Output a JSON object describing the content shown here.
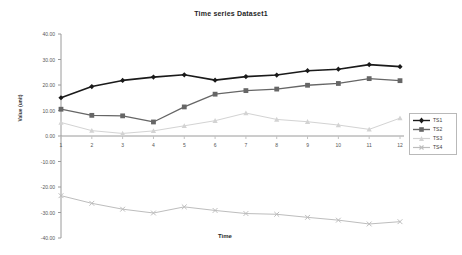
{
  "chart_data": {
    "type": "line",
    "title": "Time series Dataset1",
    "xlabel": "Time",
    "ylabel": "Value (unit)",
    "x": [
      1,
      2,
      3,
      4,
      5,
      6,
      7,
      8,
      9,
      10,
      11,
      12
    ],
    "categories": [
      "1",
      "2",
      "3",
      "4",
      "5",
      "6",
      "7",
      "8",
      "9",
      "10",
      "11",
      "12"
    ],
    "xlim": [
      1,
      12
    ],
    "ylim": [
      -40,
      40
    ],
    "ytick_labels": [
      "40.00",
      "30.00",
      "20.00",
      "10.00",
      "0.00",
      "-10.00",
      "-20.00",
      "-30.00",
      "-40.00"
    ],
    "ytick_values": [
      40,
      30,
      20,
      10,
      0,
      -10,
      -20,
      -30,
      -40
    ],
    "grid": false,
    "legend_position": "right",
    "series": [
      {
        "name": "TS1",
        "color": "#1a1a1a",
        "marker": "diamond",
        "values": [
          15.0,
          19.4,
          21.8,
          23.1,
          24.0,
          21.9,
          23.3,
          23.9,
          25.6,
          26.2,
          28.0,
          27.2
        ]
      },
      {
        "name": "TS2",
        "color": "#666666",
        "marker": "square",
        "values": [
          10.5,
          8.1,
          7.9,
          5.5,
          11.4,
          16.4,
          17.8,
          18.4,
          19.9,
          20.6,
          22.5,
          21.7
        ]
      },
      {
        "name": "TS3",
        "color": "#d3d3d3",
        "marker": "triangle",
        "values": [
          5.3,
          2.1,
          1.0,
          2.0,
          4.0,
          6.0,
          9.0,
          6.5,
          5.6,
          4.3,
          2.6,
          7.0
        ]
      },
      {
        "name": "TS4",
        "color": "#bdbdbd",
        "marker": "cross",
        "values": [
          -23.4,
          -26.4,
          -28.7,
          -30.2,
          -27.8,
          -29.2,
          -30.4,
          -30.7,
          -31.9,
          -33.0,
          -34.5,
          -33.6
        ]
      }
    ]
  }
}
